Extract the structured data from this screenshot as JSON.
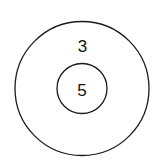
{
  "diagram": {
    "outer_circle": {
      "label": "3"
    },
    "inner_circle": {
      "label": "5"
    },
    "stroke_color": "#1a1a1a",
    "background_color": "#ffffff"
  }
}
